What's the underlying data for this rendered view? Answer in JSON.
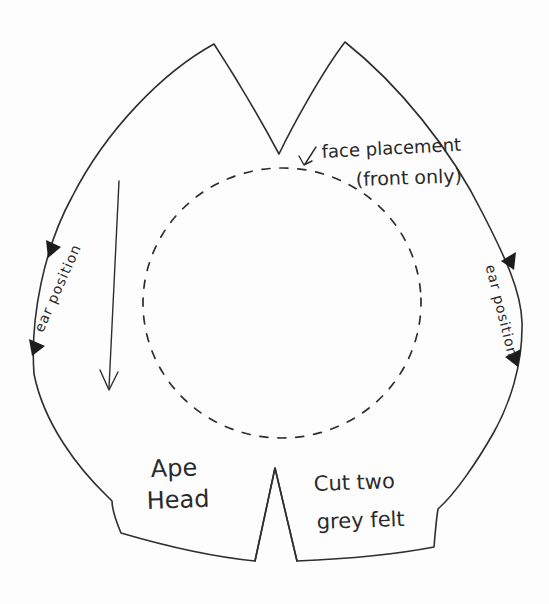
{
  "canvas": {
    "paper_color": "#fdfdfd",
    "ink_color": "#2e2e2e"
  },
  "labels": {
    "piece_name_line1": "Ape",
    "piece_name_line2": "Head",
    "cutting_line1": "Cut two",
    "cutting_line2": "grey felt",
    "face_placement_line1": "face placement",
    "face_placement_line2": "(front only)",
    "ear_left": "ear position",
    "ear_right": "ear position"
  },
  "icons": {
    "grain_arrow": "downward-arrow",
    "face_placement_pointer": "small-arrow",
    "ear_notches": "filled-triangle-marks"
  }
}
